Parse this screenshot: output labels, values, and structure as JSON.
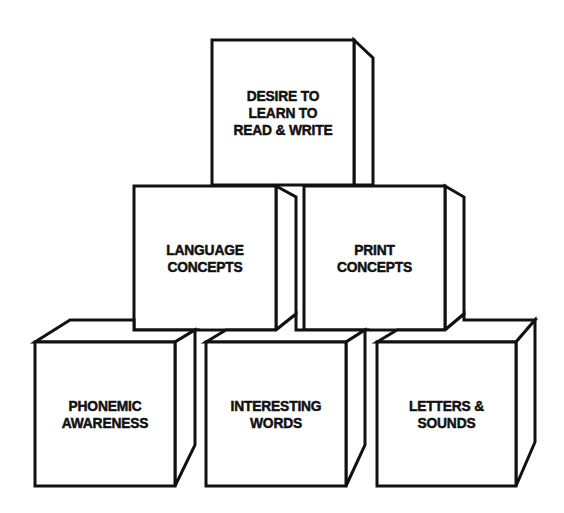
{
  "diagram": {
    "type": "stacked-blocks-pyramid",
    "colors": {
      "stroke": "#111111",
      "fill": "#ffffff",
      "text": "#111111"
    },
    "blocks": [
      {
        "id": "top",
        "row": 1,
        "lines": [
          "DESIRE TO",
          "LEARN TO",
          "READ & WRITE"
        ]
      },
      {
        "id": "language",
        "row": 2,
        "lines": [
          "LANGUAGE",
          "CONCEPTS"
        ]
      },
      {
        "id": "print",
        "row": 2,
        "lines": [
          "PRINT",
          "CONCEPTS"
        ]
      },
      {
        "id": "phonemic",
        "row": 3,
        "lines": [
          "PHONEMIC",
          "AWARENESS"
        ]
      },
      {
        "id": "interesting",
        "row": 3,
        "lines": [
          "INTERESTING",
          "WORDS"
        ]
      },
      {
        "id": "letters",
        "row": 3,
        "lines": [
          "LETTERS &",
          "SOUNDS"
        ]
      }
    ]
  }
}
